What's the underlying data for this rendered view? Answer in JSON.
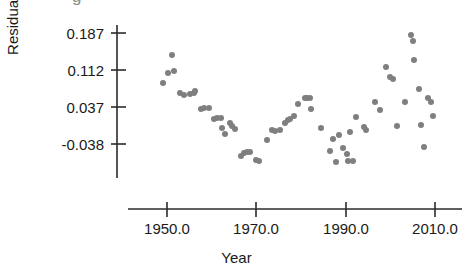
{
  "figure": {
    "title_sliver": "g",
    "background": "#ffffff",
    "point_color": "#7f7f7f",
    "axis_color": "#2b2b2b",
    "text_color": "#1a1a1a"
  },
  "axes": {
    "ylabel": "Residuals",
    "xlabel": "Year",
    "yticks": [
      "-0.038",
      "0.037",
      "0.112",
      "0.187"
    ],
    "xticks": [
      "1950.0",
      "1970.0",
      "1990.0",
      "2010.0"
    ]
  },
  "chart_data": {
    "type": "scatter",
    "title": "",
    "xlabel": "Year",
    "ylabel": "Residuals",
    "xlim": [
      1944.0,
      2013.5
    ],
    "ylim": [
      -0.083,
      0.205
    ],
    "xticks": [
      1950.0,
      1970.0,
      1990.0,
      2010.0
    ],
    "xtick_labels": [
      "1950.0",
      "1970.0",
      "1990.0",
      "2010.0"
    ],
    "yticks": [
      -0.038,
      0.037,
      0.112,
      0.187
    ],
    "ytick_labels": [
      "-0.038",
      "0.037",
      "0.112",
      "0.187"
    ],
    "grid": false,
    "legend": false,
    "marker": "circle",
    "marker_color": "#7f7f7f",
    "marker_size": 6,
    "n_points": 66,
    "series": [
      {
        "name": "Residuals",
        "points": [
          {
            "x": 1949.2,
            "y": 0.085
          },
          {
            "x": 1950.3,
            "y": 0.106
          },
          {
            "x": 1951.2,
            "y": 0.142
          },
          {
            "x": 1951.5,
            "y": 0.11
          },
          {
            "x": 1953.0,
            "y": 0.065
          },
          {
            "x": 1953.9,
            "y": 0.062
          },
          {
            "x": 1955.2,
            "y": 0.063
          },
          {
            "x": 1956.0,
            "y": 0.066
          },
          {
            "x": 1956.3,
            "y": 0.069
          },
          {
            "x": 1957.5,
            "y": 0.033
          },
          {
            "x": 1958.2,
            "y": 0.034
          },
          {
            "x": 1959.4,
            "y": 0.035
          },
          {
            "x": 1960.6,
            "y": 0.012
          },
          {
            "x": 1961.2,
            "y": 0.015
          },
          {
            "x": 1962.0,
            "y": 0.014
          },
          {
            "x": 1962.4,
            "y": -0.005
          },
          {
            "x": 1962.9,
            "y": -0.017
          },
          {
            "x": 1964.0,
            "y": 0.005
          },
          {
            "x": 1964.6,
            "y": -0.002
          },
          {
            "x": 1965.2,
            "y": -0.008
          },
          {
            "x": 1966.5,
            "y": -0.062
          },
          {
            "x": 1967.2,
            "y": -0.057
          },
          {
            "x": 1967.9,
            "y": -0.054
          },
          {
            "x": 1968.5,
            "y": -0.054
          },
          {
            "x": 1970.0,
            "y": -0.07
          },
          {
            "x": 1970.7,
            "y": -0.072
          },
          {
            "x": 1972.4,
            "y": -0.03
          },
          {
            "x": 1973.5,
            "y": -0.01
          },
          {
            "x": 1974.2,
            "y": -0.012
          },
          {
            "x": 1975.4,
            "y": -0.01
          },
          {
            "x": 1976.5,
            "y": 0.005
          },
          {
            "x": 1977.0,
            "y": 0.01
          },
          {
            "x": 1977.6,
            "y": 0.013
          },
          {
            "x": 1978.4,
            "y": 0.018
          },
          {
            "x": 1979.3,
            "y": 0.044
          },
          {
            "x": 1980.8,
            "y": 0.055
          },
          {
            "x": 1981.3,
            "y": 0.056
          },
          {
            "x": 1982.0,
            "y": 0.055
          },
          {
            "x": 1982.2,
            "y": 0.033
          },
          {
            "x": 1984.5,
            "y": -0.005
          },
          {
            "x": 1986.5,
            "y": -0.052
          },
          {
            "x": 1987.2,
            "y": -0.027
          },
          {
            "x": 1987.8,
            "y": -0.074
          },
          {
            "x": 1988.4,
            "y": -0.02
          },
          {
            "x": 1989.4,
            "y": -0.046
          },
          {
            "x": 1990.2,
            "y": -0.058
          },
          {
            "x": 1990.6,
            "y": -0.072
          },
          {
            "x": 1991.0,
            "y": -0.014
          },
          {
            "x": 1991.7,
            "y": -0.072
          },
          {
            "x": 1992.3,
            "y": 0.017
          },
          {
            "x": 1994.2,
            "y": -0.004
          },
          {
            "x": 1994.6,
            "y": -0.01
          },
          {
            "x": 1996.5,
            "y": 0.048
          },
          {
            "x": 1997.6,
            "y": 0.031
          },
          {
            "x": 1999.0,
            "y": 0.119
          },
          {
            "x": 1999.9,
            "y": 0.098
          },
          {
            "x": 2000.6,
            "y": 0.093
          },
          {
            "x": 2001.4,
            "y": -0.001
          },
          {
            "x": 2003.2,
            "y": 0.048
          },
          {
            "x": 2004.6,
            "y": 0.182
          },
          {
            "x": 2005.0,
            "y": 0.17
          },
          {
            "x": 2005.2,
            "y": 0.133
          },
          {
            "x": 2006.4,
            "y": 0.074
          },
          {
            "x": 2006.8,
            "y": 0.001
          },
          {
            "x": 2007.6,
            "y": -0.044
          },
          {
            "x": 2008.4,
            "y": 0.055
          },
          {
            "x": 2009.0,
            "y": 0.048
          },
          {
            "x": 2009.6,
            "y": 0.019
          }
        ]
      }
    ]
  }
}
